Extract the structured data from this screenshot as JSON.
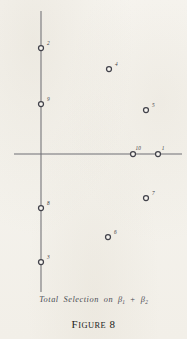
{
  "figure": {
    "number_label": "FIGURE 8",
    "figure_word": "F",
    "figure_word_rest": "IGURE",
    "figure_number": "8",
    "caption_prefix": "Total  Selection  on",
    "caption_symbol_1": "β",
    "caption_symbol_1_sub": "1",
    "caption_operator": "+",
    "caption_symbol_2": "β",
    "caption_symbol_2_sub": "2",
    "caption_full": "Total Selection on β₁ + β₂"
  },
  "colors": {
    "paper": "#f6f4ef",
    "axis": "#6f6f74",
    "marker_stroke": "#42424a",
    "marker_fill": "#f6f4ef",
    "label_text": "#3b3b42",
    "caption_text": "#4a4a52",
    "figure_text": "#1c1c20"
  },
  "chart_data": {
    "type": "scatter",
    "xlabel": "",
    "ylabel": "",
    "grid": false,
    "legend": "none",
    "axes": {
      "origin_px": [
        41,
        154
      ],
      "x_axis_px": {
        "x1": 14,
        "x2": 182,
        "y": 154
      },
      "y_axis_px": {
        "y1": 11,
        "y2": 292,
        "x": 41
      },
      "xlim_px": [
        14,
        182
      ],
      "ylim_px": [
        11,
        292
      ]
    },
    "marker": {
      "shape": "open-circle",
      "radius_px": 2.5
    },
    "points": [
      {
        "label": "2",
        "x_px": 41,
        "y_px": 48,
        "label_dx": 3.6,
        "label_dy": -2.8
      },
      {
        "label": "4",
        "x_px": 109,
        "y_px": 69,
        "label_dx": 3.6,
        "label_dy": -2.8
      },
      {
        "label": "9",
        "x_px": 41,
        "y_px": 104,
        "label_dx": 3.6,
        "label_dy": -2.8
      },
      {
        "label": "5",
        "x_px": 146,
        "y_px": 110,
        "label_dx": 3.6,
        "label_dy": -2.8
      },
      {
        "label": "10",
        "x_px": 133,
        "y_px": 154,
        "label_dx": 0.0,
        "label_dy": -4.2
      },
      {
        "label": "1",
        "x_px": 158,
        "y_px": 154,
        "label_dx": 1.2,
        "label_dy": -4.2
      },
      {
        "label": "7",
        "x_px": 146,
        "y_px": 198,
        "label_dx": 3.6,
        "label_dy": -2.8
      },
      {
        "label": "8",
        "x_px": 41,
        "y_px": 208,
        "label_dx": 3.6,
        "label_dy": -2.8
      },
      {
        "label": "6",
        "x_px": 108,
        "y_px": 237,
        "label_dx": 3.6,
        "label_dy": -2.8
      },
      {
        "label": "3",
        "x_px": 41,
        "y_px": 262,
        "label_dx": 3.6,
        "label_dy": -2.8
      }
    ]
  }
}
